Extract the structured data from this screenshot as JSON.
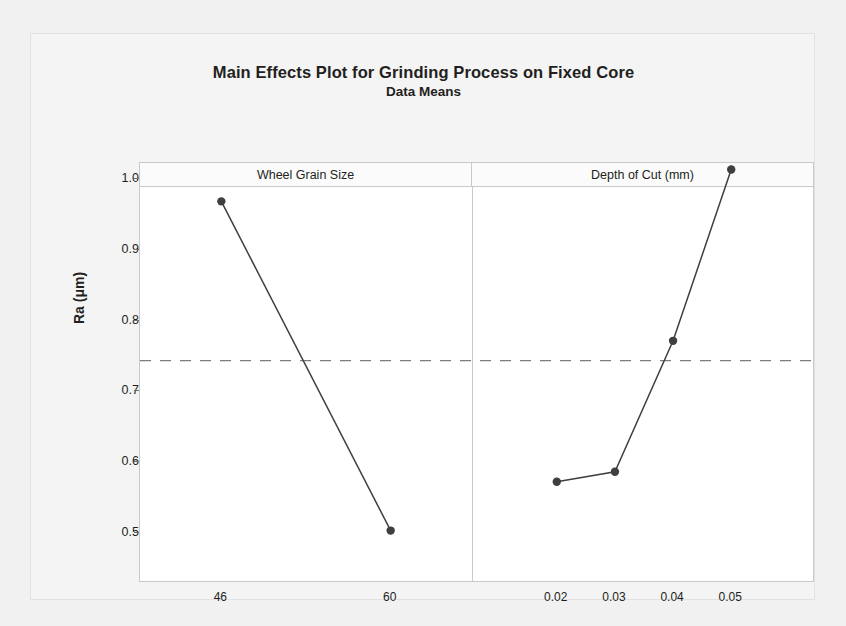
{
  "chart_data": {
    "type": "line",
    "title": "Main Effects Plot for Grinding Process on Fixed Core",
    "subtitle": "Data Means",
    "ylabel": "Ra (μm)",
    "xlabel": "",
    "ylim": [
      0.45,
      1.05
    ],
    "yticks": [
      "1.0",
      "0.9",
      "0.8",
      "0.7",
      "0.6",
      "0.5"
    ],
    "ytick_values": [
      1.0,
      0.9,
      0.8,
      0.7,
      0.6,
      0.5
    ],
    "grid": false,
    "legend": "none",
    "reference_line": {
      "value": 0.742,
      "style": "dashed",
      "label": "grand mean"
    },
    "panels": [
      {
        "name": "Wheel Grain Size",
        "categories": [
          "46",
          "60"
        ],
        "values": [
          0.967,
          0.502
        ]
      },
      {
        "name": "Depth of Cut (mm)",
        "categories": [
          "0.02",
          "0.03",
          "0.04",
          "0.05"
        ],
        "values": [
          0.571,
          0.585,
          0.77,
          1.012
        ]
      }
    ],
    "colors": {
      "line": "#3f3f3f",
      "marker": "#3f3f3f",
      "reference_line": "#7d7d7d",
      "frame": "#c9c9c9",
      "text": "#231f20",
      "plot_background": "#ffffff",
      "figure_background": "#f1f1f1"
    }
  }
}
